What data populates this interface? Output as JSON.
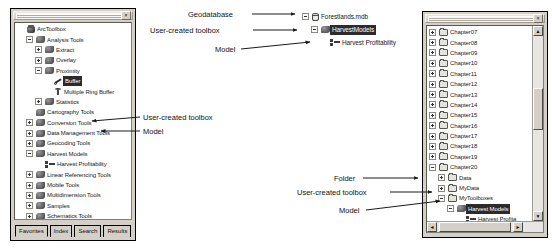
{
  "left_panel": {
    "title": "ArcToolbox window",
    "close_label": "×",
    "tree": [
      {
        "label": "ArcToolbox",
        "icon": "toolbox-icon",
        "depth": 0,
        "expander": "none"
      },
      {
        "label": "Analysis Tools",
        "icon": "tools-icon",
        "depth": 1,
        "expander": "minus"
      },
      {
        "label": "Extract",
        "icon": "tools-icon",
        "depth": 2,
        "expander": "plus"
      },
      {
        "label": "Overlay",
        "icon": "tools-icon",
        "depth": 2,
        "expander": "plus"
      },
      {
        "label": "Proximity",
        "icon": "tools-icon",
        "depth": 2,
        "expander": "minus"
      },
      {
        "label": "Buffer",
        "icon": "wrench-icon",
        "depth": 3,
        "expander": "none",
        "selected": true
      },
      {
        "label": "Multiple Ring Buffer",
        "icon": "tool-icon",
        "depth": 3,
        "expander": "none"
      },
      {
        "label": "Statistics",
        "icon": "tools-icon",
        "depth": 2,
        "expander": "plus"
      },
      {
        "label": "Cartography Tools",
        "icon": "tools-icon",
        "depth": 1,
        "expander": "none"
      },
      {
        "label": "Conversion Tools",
        "icon": "tools-icon",
        "depth": 1,
        "expander": "plus"
      },
      {
        "label": "Data Management Tools",
        "icon": "tools-icon",
        "depth": 1,
        "expander": "plus"
      },
      {
        "label": "Geocoding Tools",
        "icon": "tools-icon",
        "depth": 1,
        "expander": "plus"
      },
      {
        "label": "Harvest Models",
        "icon": "tools-icon",
        "depth": 1,
        "expander": "minus"
      },
      {
        "label": "Harvest Profitability",
        "icon": "model-icon",
        "depth": 2,
        "expander": "none"
      },
      {
        "label": "Linear Referencing Tools",
        "icon": "tools-icon",
        "depth": 1,
        "expander": "plus"
      },
      {
        "label": "Mobile Tools",
        "icon": "tools-icon",
        "depth": 1,
        "expander": "plus"
      },
      {
        "label": "Multidimension Tools",
        "icon": "tools-icon",
        "depth": 1,
        "expander": "plus"
      },
      {
        "label": "Samples",
        "icon": "tools-icon",
        "depth": 1,
        "expander": "plus"
      },
      {
        "label": "Schematics Tools",
        "icon": "tools-icon",
        "depth": 1,
        "expander": "plus"
      },
      {
        "label": "Server Tools",
        "icon": "tools-icon",
        "depth": 1,
        "expander": "plus"
      },
      {
        "label": "Spatial Statistics Tools",
        "icon": "tools-icon",
        "depth": 1,
        "expander": "plus"
      }
    ],
    "tabs": [
      {
        "label": "Favorites",
        "active": true
      },
      {
        "label": "Index",
        "active": false
      },
      {
        "label": "Search",
        "active": false
      },
      {
        "label": "Results",
        "active": false
      }
    ]
  },
  "middle_tree": {
    "rows": [
      {
        "label": "Forestlands.mdb",
        "icon": "geodatabase-icon",
        "depth": 0,
        "expander": "minus"
      },
      {
        "label": "HarvestModels",
        "icon": "tools-icon",
        "depth": 1,
        "expander": "minus",
        "selected": true
      },
      {
        "label": "Harvest Profitability",
        "icon": "model-icon",
        "depth": 2,
        "expander": "none"
      }
    ]
  },
  "right_panel": {
    "title": "Catalog tree window",
    "close_label": "×",
    "tree": [
      {
        "label": "Chapter07",
        "icon": "folder-icon",
        "depth": 0,
        "expander": "plus"
      },
      {
        "label": "Chapter08",
        "icon": "folder-icon",
        "depth": 0,
        "expander": "plus"
      },
      {
        "label": "Chapter09",
        "icon": "folder-icon",
        "depth": 0,
        "expander": "plus"
      },
      {
        "label": "Chapter10",
        "icon": "folder-icon",
        "depth": 0,
        "expander": "plus"
      },
      {
        "label": "Chapter11",
        "icon": "folder-icon",
        "depth": 0,
        "expander": "plus"
      },
      {
        "label": "Chapter12",
        "icon": "folder-icon",
        "depth": 0,
        "expander": "plus"
      },
      {
        "label": "Chapter13",
        "icon": "folder-icon",
        "depth": 0,
        "expander": "plus"
      },
      {
        "label": "Chapter14",
        "icon": "folder-icon",
        "depth": 0,
        "expander": "plus"
      },
      {
        "label": "Chapter15",
        "icon": "folder-icon",
        "depth": 0,
        "expander": "plus"
      },
      {
        "label": "Chapter16",
        "icon": "folder-icon",
        "depth": 0,
        "expander": "plus"
      },
      {
        "label": "Chapter17",
        "icon": "folder-icon",
        "depth": 0,
        "expander": "plus"
      },
      {
        "label": "Chapter18",
        "icon": "folder-icon",
        "depth": 0,
        "expander": "plus"
      },
      {
        "label": "Chapter19",
        "icon": "folder-icon",
        "depth": 0,
        "expander": "plus"
      },
      {
        "label": "Chapter20",
        "icon": "folder-icon",
        "depth": 0,
        "expander": "minus"
      },
      {
        "label": "Data",
        "icon": "folder-icon",
        "depth": 1,
        "expander": "plus"
      },
      {
        "label": "MyData",
        "icon": "folder-icon",
        "depth": 1,
        "expander": "plus"
      },
      {
        "label": "MyToolboxes",
        "icon": "folder-icon",
        "depth": 1,
        "expander": "minus"
      },
      {
        "label": "Harvest Models",
        "icon": "tools-icon",
        "depth": 2,
        "expander": "minus",
        "selected": true
      },
      {
        "label": "Harvest Profita",
        "icon": "model-icon",
        "depth": 3,
        "expander": "none"
      },
      {
        "label": "ex20a.mxd",
        "icon": "mxd-icon",
        "depth": 2,
        "expander": "none"
      },
      {
        "label": "ex20b.mxd",
        "icon": "mxd-icon",
        "depth": 2,
        "expander": "none"
      }
    ],
    "scroll_up_label": "▲",
    "scroll_down_label": "▼",
    "scroll_left_label": "◄",
    "scroll_right_label": "►"
  },
  "annotations": {
    "geodatabase": "Geodatabase",
    "user_created_toolbox_top": "User-created toolbox",
    "model_top": "Model",
    "user_created_toolbox_left": "User-created toolbox",
    "model_left": "Model",
    "folder_right": "Folder",
    "user_created_toolbox_right": "User-created toolbox",
    "model_right": "Model"
  },
  "colors": {
    "window_face": "#d4d0c8",
    "tree_background": "#ffffff",
    "selection": "#2b2b2b",
    "text": "#1a1a1a",
    "border": "#000000"
  }
}
